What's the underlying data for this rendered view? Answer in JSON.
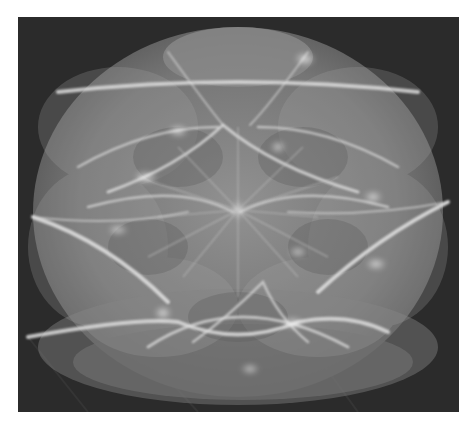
{
  "figure": {
    "colors": {
      "background": "#2a2a2a",
      "sphere_base": "#8c8c8c",
      "highlight": "#f2f2f2",
      "page": "#ffffff"
    },
    "caption": ""
  }
}
